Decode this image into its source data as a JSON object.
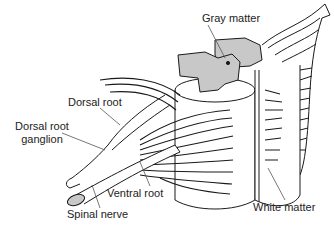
{
  "diagram": {
    "colors": {
      "gray_matter": "#c8c8c8",
      "outline": "#1a1a1a",
      "white_matter": "#ffffff"
    },
    "labels": {
      "gray_matter": "Gray matter",
      "dorsal_root": "Dorsal root",
      "dorsal_root_ganglion_line1": "Dorsal root",
      "dorsal_root_ganglion_line2": "ganglion",
      "ventral_root": "Ventral root",
      "spinal_nerve": "Spinal nerve",
      "white_matter": "White matter"
    }
  }
}
